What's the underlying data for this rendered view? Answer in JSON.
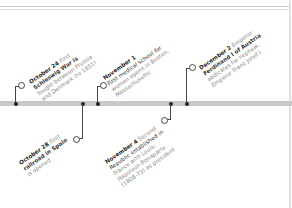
{
  "events": [
    {
      "date": "October 24",
      "lines": [
        "First",
        "Schleswig War is",
        "fought between Prussia",
        "and Denmark (to 1851)"
      ],
      "bold_lead": "Schleswig War"
    },
    {
      "date": "November 1",
      "lines": [
        "First medical school for",
        "women opens in Boston,",
        "Massachusetts"
      ],
      "bold_lead": "First medical school for women"
    },
    {
      "date": "December 2",
      "lines": [
        "Emperor",
        "Ferdinand I of Austria",
        "abdicates for nephew,",
        "Emperor Franz Josef I"
      ],
      "bold_lead": "Ferdinand I"
    },
    {
      "date": "October 28",
      "lines": [
        "First",
        "railroad in Spain",
        "is opened"
      ],
      "bold_lead": "railroad in Spain"
    },
    {
      "date": "November 4",
      "lines": [
        "Second",
        "Republic established in",
        "France with Louis-",
        "Napoleon Bonaparte",
        "(1808-73) as president"
      ],
      "bold_lead": "Republic"
    }
  ],
  "colors": {
    "timeline": "#c8c8c8",
    "stem": "#444444",
    "text": "#888888",
    "date": "#222222"
  }
}
